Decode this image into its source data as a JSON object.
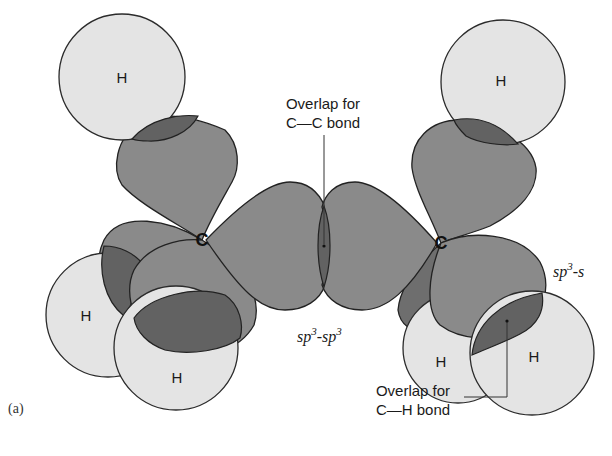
{
  "figure": {
    "panel_label": "(a)",
    "colors": {
      "orbital_fill": "#8a8a8a",
      "overlap_fill": "#626262",
      "hydrogen_fill": "#e4e4e4",
      "outline": "#222222",
      "background": "#ffffff"
    },
    "atoms": {
      "carbon_left": "C",
      "carbon_right": "C",
      "h_top_left": "H",
      "h_top_right": "H",
      "h_bottom_left_1": "H",
      "h_bottom_left_2": "H",
      "h_bottom_right_1": "H",
      "h_bottom_right_2": "H"
    },
    "annotations": {
      "cc_overlap_line1": "Overlap for",
      "cc_overlap_line2": "C—C bond",
      "ch_overlap_line1": "Overlap for",
      "ch_overlap_line2": "C—H bond",
      "sp3_sp3": {
        "base1": "sp",
        "sup1": "3",
        "dash": "-",
        "base2": "sp",
        "sup2": "3"
      },
      "sp3_s": {
        "base1": "sp",
        "sup1": "3",
        "dash": "-",
        "base2": "s"
      }
    }
  }
}
